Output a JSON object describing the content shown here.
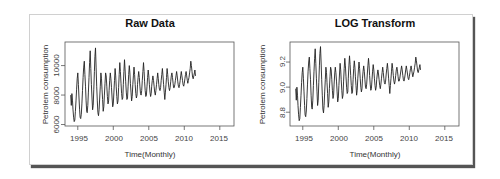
{
  "chart_data": [
    {
      "type": "line",
      "title": "Raw Data",
      "xlabel": "Time(Monthly)",
      "ylabel": "Petrolem consumption",
      "x_start": 1994.0,
      "x_step": 0.0833333,
      "xlim": [
        1993.2,
        2017.0
      ],
      "ylim": [
        5900,
        11600
      ],
      "xticks": [
        1995,
        2000,
        2005,
        2010,
        2015
      ],
      "yticks": [
        6000,
        8000,
        10000
      ],
      "grid": false,
      "legend": null,
      "annual_summary": [
        {
          "year": 1994,
          "peak": 8100,
          "trough": 6200
        },
        {
          "year": 1995,
          "peak": 9500,
          "trough": 6400
        },
        {
          "year": 1996,
          "peak": 10300,
          "trough": 6800
        },
        {
          "year": 1997,
          "peak": 11000,
          "trough": 7000
        },
        {
          "year": 1998,
          "peak": 11200,
          "trough": 6600
        },
        {
          "year": 1999,
          "peak": 9500,
          "trough": 6900
        },
        {
          "year": 2000,
          "peak": 9500,
          "trough": 7400
        },
        {
          "year": 2001,
          "peak": 9800,
          "trough": 7200
        },
        {
          "year": 2002,
          "peak": 10200,
          "trough": 7400
        },
        {
          "year": 2003,
          "peak": 10400,
          "trough": 7700
        },
        {
          "year": 2004,
          "peak": 10000,
          "trough": 7700
        },
        {
          "year": 2005,
          "peak": 9900,
          "trough": 7600
        },
        {
          "year": 2006,
          "peak": 9600,
          "trough": 7800
        },
        {
          "year": 2007,
          "peak": 10200,
          "trough": 8000
        },
        {
          "year": 2008,
          "peak": 9700,
          "trough": 7900
        },
        {
          "year": 2009,
          "peak": 9300,
          "trough": 8000
        },
        {
          "year": 2010,
          "peak": 9500,
          "trough": 8300
        },
        {
          "year": 2011,
          "peak": 9800,
          "trough": 7700
        },
        {
          "year": 2012,
          "peak": 9800,
          "trough": 8300
        },
        {
          "year": 2013,
          "peak": 9500,
          "trough": 8500
        },
        {
          "year": 2014,
          "peak": 9600,
          "trough": 8500
        },
        {
          "year": 2015,
          "peak": 9600,
          "trough": 8600
        },
        {
          "year": 2016,
          "peak": 10300,
          "trough": 9100
        }
      ],
      "values": [
        8000,
        7300,
        8100,
        7600,
        7000,
        6500,
        6200,
        6300,
        6900,
        7600,
        8400,
        9100,
        9500,
        8700,
        7800,
        7000,
        6500,
        6400,
        6700,
        7400,
        8300,
        9200,
        9900,
        10300,
        9400,
        8600,
        7600,
        6900,
        6800,
        7300,
        8200,
        9200,
        10200,
        11000,
        9800,
        8700,
        7800,
        7000,
        7300,
        8400,
        9600,
        10600,
        11200,
        9900,
        8600,
        7600,
        6800,
        6600,
        7000,
        7800,
        8600,
        9500,
        9100,
        8400,
        7700,
        6900,
        7200,
        8000,
        8800,
        9500,
        9300,
        8600,
        7900,
        7400,
        7600,
        8300,
        9000,
        9500,
        9100,
        8500,
        7800,
        7200,
        7400,
        8200,
        9000,
        9800,
        9300,
        8600,
        7900,
        7400,
        7600,
        8500,
        9400,
        10200,
        9600,
        8800,
        8100,
        7700,
        7800,
        8700,
        9600,
        10400,
        9700,
        8900,
        8200,
        7700,
        7800,
        8600,
        9400,
        10000,
        9500,
        8800,
        8200,
        7600,
        7900,
        8700,
        9300,
        9900,
        9400,
        8700,
        8100,
        7800,
        8000,
        8700,
        9200,
        9600,
        9200,
        8600,
        8100,
        8000,
        8300,
        9000,
        9600,
        10200,
        9600,
        8900,
        8300,
        7900,
        8000,
        8600,
        9200,
        9700,
        9300,
        8700,
        8200,
        7900,
        8100,
        8600,
        9000,
        9300,
        9000,
        8600,
        8200,
        8000,
        8300,
        8700,
        9100,
        9500,
        9100,
        8700,
        8400,
        8300,
        8500,
        9000,
        9400,
        9800,
        9300,
        8700,
        8200,
        7700,
        8200,
        8700,
        9200,
        9800,
        9400,
        8900,
        8500,
        8300,
        8500,
        8900,
        9300,
        9500,
        9200,
        8800,
        8500,
        8500,
        8700,
        9000,
        9300,
        9600,
        9300,
        8900,
        8600,
        8500,
        8700,
        9000,
        9300,
        9600,
        9300,
        9000,
        8700,
        8600,
        8800,
        9100,
        9400,
        9600,
        9300,
        9000,
        8800,
        9000,
        9200,
        9500,
        9800,
        10300,
        10000,
        9600,
        9200,
        9100,
        9300,
        9500,
        9700,
        9300
      ]
    },
    {
      "type": "line",
      "title": "LOG Transform",
      "xlabel": "Time(Monthly)",
      "ylabel": "Petrolem consumption",
      "x_start": 1994.0,
      "x_step": 0.0833333,
      "xlim": [
        1993.2,
        2017.0
      ],
      "ylim": [
        8.69,
        9.36
      ],
      "xticks": [
        1995,
        2000,
        2005,
        2010,
        2015
      ],
      "yticks": [
        8.8,
        9.0,
        9.2
      ],
      "grid": false,
      "legend": null,
      "transform": "natural log of Raw Data values"
    }
  ],
  "panels": {
    "left": {
      "title": "Raw Data",
      "xlabel": "Time(Monthly)",
      "ylabel": "Petrolem consumption",
      "yticks": [
        "6000",
        "8000",
        "10000"
      ],
      "xticks": [
        "1995",
        "2000",
        "2005",
        "2010",
        "2015"
      ]
    },
    "right": {
      "title": "LOG Transform",
      "xlabel": "Time(Monthly)",
      "ylabel": "Petrolem consumption",
      "yticks": [
        "8.8",
        "9.0",
        "9.2"
      ],
      "xticks": [
        "1995",
        "2000",
        "2005",
        "2010",
        "2015"
      ]
    }
  }
}
